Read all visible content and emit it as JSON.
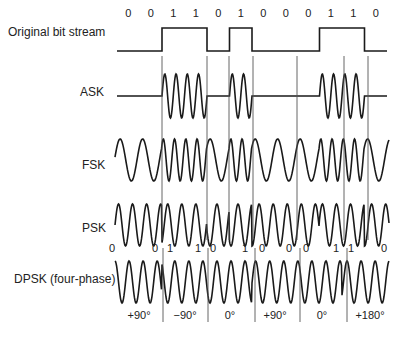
{
  "rows": [
    {
      "label": "Original bit stream",
      "label_x": 8,
      "label_y": 33
    },
    {
      "label": "ASK",
      "label_x": 80,
      "label_y": 93
    },
    {
      "label": "FSK",
      "label_x": 82,
      "label_y": 166
    },
    {
      "label": "PSK",
      "label_x": 82,
      "label_y": 229
    },
    {
      "label": "DPSK (four-phase)",
      "label_x": 14,
      "label_y": 280
    }
  ],
  "bits": {
    "values": [
      0,
      0,
      1,
      1,
      0,
      1,
      0,
      0,
      0,
      1,
      1,
      0
    ],
    "labels": [
      "0",
      "0",
      "1",
      "1",
      "0",
      "1",
      "0",
      "0",
      "0",
      "1",
      "1",
      "0"
    ],
    "x_start": 117,
    "bit_width": 22.5,
    "label_y": 13
  },
  "dpsk_bits": {
    "labels": [
      "0",
      "0",
      "1",
      "1",
      "0",
      "1",
      "0",
      "0",
      "0",
      "1",
      "1",
      "0"
    ],
    "positions": [
      112,
      155,
      170,
      198,
      213,
      245,
      262,
      289,
      306,
      336,
      351,
      384
    ],
    "label_y": 248
  },
  "phases": {
    "labels": [
      "+90°",
      "−90°",
      "0°",
      "+90°",
      "0°",
      "+180°"
    ],
    "positions": [
      139,
      185,
      230,
      275,
      322,
      370
    ],
    "label_y": 315
  },
  "boundaries": {
    "upper": [
      162,
      207,
      229,
      253,
      297,
      344,
      368
    ],
    "dpsk": [
      163,
      208,
      255,
      300,
      347
    ]
  },
  "colors": {
    "stroke": "#1a1a1a",
    "divider": "#555555",
    "text": "#222222"
  }
}
